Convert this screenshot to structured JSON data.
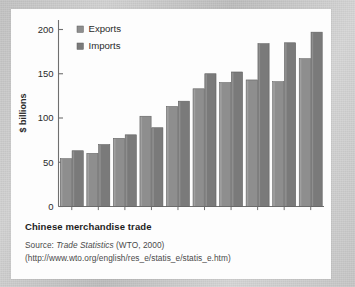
{
  "figure": {
    "caption_title": "Chinese merchandise trade",
    "source_prefix": "Source: ",
    "source_italic": "Trade Statistics",
    "source_suffix": " (WTO, 2000)",
    "source_url": "(http://www.wto.org/english/res_e/statis_e/statis_e.htm)"
  },
  "chart_data": {
    "type": "bar",
    "title": "Chinese merchandise trade",
    "xlabel": "",
    "ylabel": "$ billions",
    "categories": [
      "1990",
      "1991",
      "1992",
      "1993",
      "1994",
      "1995",
      "1996",
      "1997",
      "1998",
      "1999"
    ],
    "series": [
      {
        "name": "Exports",
        "color": "#8e8e8e",
        "values": [
          54,
          60,
          77,
          102,
          113,
          133,
          140,
          143,
          141,
          167
        ]
      },
      {
        "name": "Imports",
        "color": "#7a7a7a",
        "values": [
          63,
          70,
          81,
          89,
          119,
          150,
          152,
          184,
          185,
          197
        ]
      }
    ],
    "ylim": [
      0,
      200
    ],
    "yticks": [
      "0",
      "50",
      "100",
      "150",
      "200"
    ],
    "ytick_values": [
      0,
      50,
      100,
      150,
      200
    ],
    "grid": false,
    "legend_position": "top-left"
  }
}
